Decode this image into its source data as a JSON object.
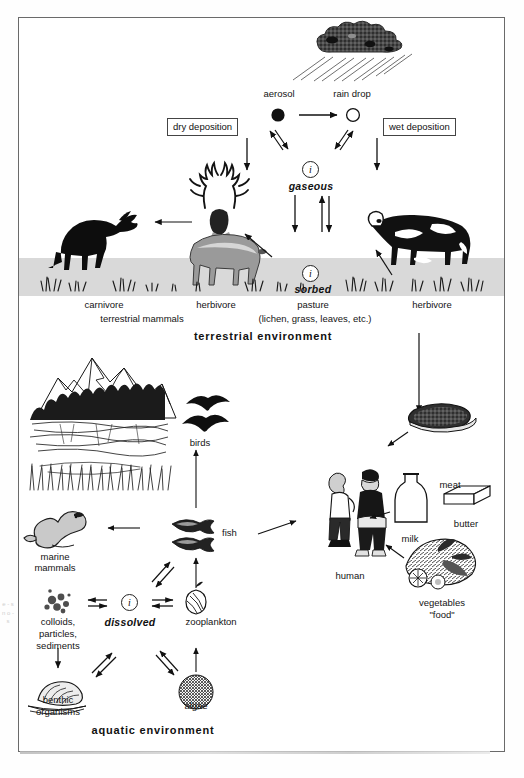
{
  "diagram": {
    "title_terrestrial": "terrestrial environment",
    "title_aquatic": "aquatic environment",
    "boxes": {
      "dry_deposition": "dry deposition",
      "wet_deposition": "wet deposition"
    },
    "atmosphere": {
      "aerosol": "aerosol",
      "rain_drop": "rain drop",
      "gaseous": "gaseous",
      "i_symbol": "i"
    },
    "terrestrial": {
      "carnivore": "carnivore",
      "terrestrial_mammals": "terrestrial mammals",
      "herbivore_deer": "herbivore",
      "herbivore_cow": "herbivore",
      "pasture": "pasture",
      "pasture_detail": "(lichen, grass, leaves, etc.)",
      "sorbed": "sorbed",
      "i_symbol": "i"
    },
    "aquatic": {
      "birds": "birds",
      "fish": "fish",
      "marine_mammals_line1": "marine",
      "marine_mammals_line2": "mammals",
      "colloids_line1": "colloids,",
      "colloids_line2": "particles,",
      "colloids_line3": "sediments",
      "dissolved": "dissolved",
      "i_symbol": "i",
      "zooplankton": "zooplankton",
      "benthic_line1": "benthic",
      "benthic_line2": "organisms",
      "algae": "algae"
    },
    "human_food": {
      "human": "human",
      "meat": "meat",
      "milk": "milk",
      "butter": "butter",
      "vegetables_line1": "vegetables",
      "vegetables_line2": "\"food\""
    },
    "margin_bleed": "e - s n o - s",
    "colors": {
      "frame": "#6a6a6a",
      "ground_band": "#d9d9d9",
      "ink": "#141414",
      "deer_body": "#9a9a9a",
      "page": "#ffffff"
    }
  }
}
